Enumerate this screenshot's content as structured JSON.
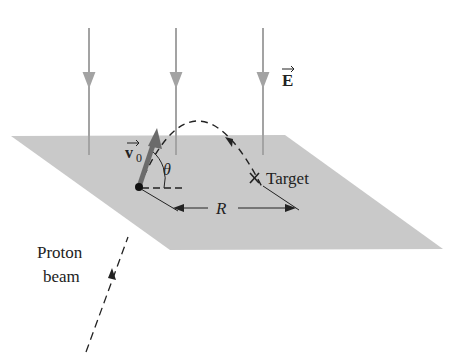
{
  "diagram": {
    "type": "physics-projectile-in-electric-field",
    "labels": {
      "field": "E",
      "velocity": "v",
      "velocity_subscript": "0",
      "angle": "θ",
      "target": "Target",
      "range": "R",
      "beam_line1": "Proton",
      "beam_line2": "beam"
    },
    "colors": {
      "plane": "#c9c9c9",
      "field_lines": "#a3a3a3",
      "velocity_arrow": "#6b6b6b",
      "ink": "#222222"
    },
    "field_line_count": 3
  }
}
